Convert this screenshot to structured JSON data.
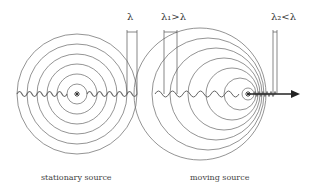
{
  "panels": [
    {
      "id": "stationary",
      "caption": "stationary source",
      "wavelength_label": "λ",
      "source_symbol": "*"
    },
    {
      "id": "moving",
      "caption": "moving source",
      "wavelength_label_behind": "λ₁>λ",
      "wavelength_label_ahead": "λ₂<λ",
      "source_symbol": "*",
      "motion": "arrow pointing right"
    }
  ],
  "colors": {
    "lines": "#555555",
    "wave": "#666666",
    "arrow": "#222222",
    "background": "#ffffff"
  }
}
